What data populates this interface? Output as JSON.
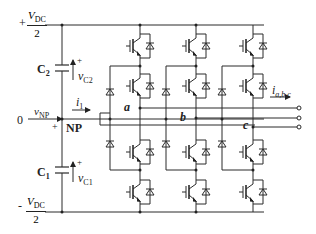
{
  "diagram": {
    "dc_top": {
      "sign": "+",
      "num": "V",
      "num_sub": "DC",
      "den": "2"
    },
    "dc_bottom": {
      "sign": "-",
      "num": "V",
      "num_sub": "DC",
      "den": "2"
    },
    "capacitors": [
      {
        "name": "C",
        "sub": "2",
        "voltage": "v",
        "voltage_sub": "C2",
        "polarity": "+"
      },
      {
        "name": "C",
        "sub": "1",
        "voltage": "v",
        "voltage_sub": "C1",
        "polarity": "+"
      }
    ],
    "neutral": {
      "zero": "0",
      "v": "v",
      "v_sub": "NP",
      "label": "NP",
      "plus": "+",
      "current": "i",
      "current_sub": "1"
    },
    "phases": [
      "a",
      "b",
      "c"
    ],
    "output_current": {
      "i": "i",
      "sub": "a,b,c"
    },
    "colors": {
      "line": "#2a2a2a",
      "background": "#ffffff"
    }
  }
}
